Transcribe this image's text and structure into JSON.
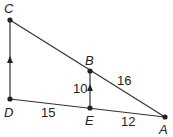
{
  "diagram": {
    "points": {
      "C": {
        "label": "C",
        "x": 10,
        "y": 20
      },
      "D": {
        "label": "D",
        "x": 10,
        "y": 99
      },
      "B": {
        "label": "B",
        "x": 90,
        "y": 71
      },
      "E": {
        "label": "E",
        "x": 90,
        "y": 108
      },
      "A": {
        "label": "A",
        "x": 165,
        "y": 117
      }
    },
    "segments": [
      {
        "from": "C",
        "to": "A"
      },
      {
        "from": "D",
        "to": "A"
      },
      {
        "from": "C",
        "to": "D"
      },
      {
        "from": "B",
        "to": "E"
      }
    ],
    "lengths": {
      "BE": "10",
      "BA": "16",
      "DE": "15",
      "EA": "12"
    },
    "parallel_marks": [
      "CD",
      "BE"
    ],
    "line_color": "#333333"
  }
}
